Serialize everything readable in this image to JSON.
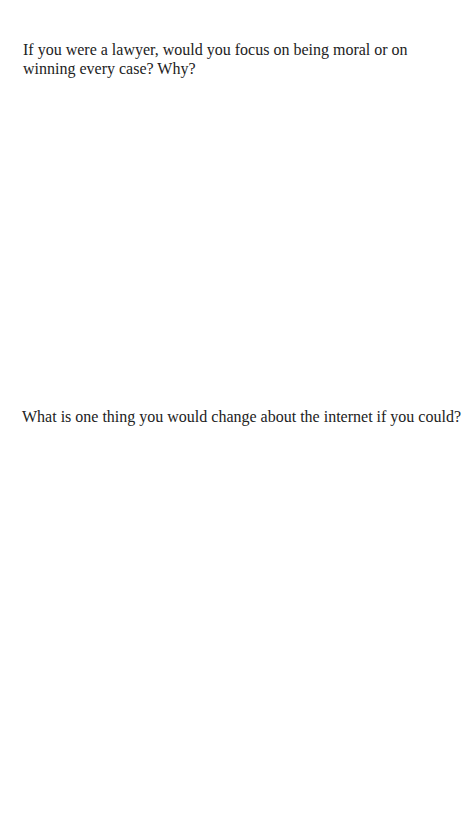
{
  "page": {
    "questions": [
      {
        "text": "If you were a lawyer, would you focus on being moral or on winning every case? Why?"
      },
      {
        "text": "What is one thing you would change about the internet if you could?"
      }
    ]
  }
}
